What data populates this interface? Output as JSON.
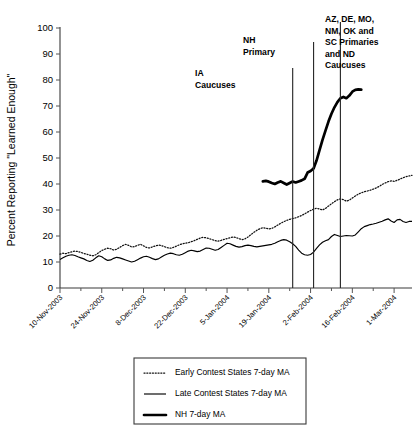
{
  "chart_data": {
    "type": "line",
    "title": "",
    "xlabel": "",
    "ylabel": "Percent Reporting \"Learned Enough\"",
    "ylim": [
      0,
      100
    ],
    "ytick_labels": [
      "0",
      "10",
      "20",
      "30",
      "40",
      "50",
      "60",
      "70",
      "80",
      "90",
      "100"
    ],
    "ytick_values": [
      0,
      10,
      20,
      30,
      40,
      50,
      60,
      70,
      80,
      90,
      100
    ],
    "grid": false,
    "legend_position": "below-plot",
    "x_axis_type": "date",
    "xtick_labels": [
      "10-Nov-2003",
      "24-Nov-2003",
      "8-Dec-2003",
      "22-Dec-2003",
      "5-Jan-2004",
      "19-Jan-2004",
      "2-Feb-2004",
      "16-Feb-2004",
      "1-Mar-2004"
    ],
    "xtick_day_indices": [
      0,
      14,
      28,
      42,
      56,
      70,
      84,
      98,
      112
    ],
    "x_range_days": [
      0,
      118
    ],
    "series": [
      {
        "name": "Early Contest States 7-day MA",
        "style": "dotted",
        "start_day": 0,
        "values": [
          13.0,
          13.4,
          13.2,
          13.6,
          13.9,
          14.2,
          14.0,
          13.7,
          13.3,
          13.0,
          12.6,
          12.4,
          12.8,
          13.6,
          14.4,
          14.9,
          15.3,
          15.1,
          14.6,
          14.9,
          15.6,
          16.3,
          16.8,
          16.4,
          15.8,
          15.9,
          16.4,
          16.8,
          16.2,
          15.6,
          15.4,
          15.8,
          16.2,
          16.5,
          16.3,
          15.9,
          15.5,
          15.3,
          15.6,
          16.1,
          16.6,
          17.0,
          17.2,
          17.4,
          17.8,
          18.2,
          18.7,
          19.2,
          19.5,
          19.3,
          19.0,
          18.6,
          18.2,
          18.0,
          18.3,
          18.7,
          19.0,
          19.3,
          19.6,
          19.4,
          19.0,
          18.6,
          18.9,
          19.6,
          20.5,
          21.4,
          22.2,
          22.8,
          23.2,
          23.0,
          22.7,
          22.9,
          23.5,
          24.2,
          24.9,
          25.5,
          26.0,
          26.4,
          26.7,
          27.0,
          27.4,
          27.9,
          28.5,
          29.2,
          29.8,
          30.3,
          30.7,
          30.4,
          30.0,
          30.6,
          31.5,
          32.4,
          33.2,
          33.9,
          34.3,
          34.0,
          33.4,
          33.8,
          34.6,
          35.4,
          36.1,
          36.6,
          37.0,
          37.3,
          37.6,
          38.0,
          38.5,
          39.1,
          39.8,
          40.4,
          40.9,
          41.2,
          41.0,
          41.4,
          41.9,
          42.4,
          42.8,
          43.1,
          43.3
        ]
      },
      {
        "name": "Late Contest States 7-day MA",
        "style": "solid-thin",
        "start_day": 0,
        "values": [
          11.0,
          11.6,
          12.2,
          12.6,
          12.8,
          12.5,
          12.0,
          11.6,
          11.2,
          10.6,
          10.2,
          10.7,
          11.6,
          12.4,
          12.0,
          11.2,
          10.6,
          10.8,
          11.4,
          11.8,
          11.6,
          11.2,
          10.8,
          10.4,
          10.0,
          10.3,
          10.9,
          11.5,
          12.0,
          12.2,
          11.8,
          11.3,
          10.9,
          11.2,
          11.9,
          12.6,
          13.1,
          13.4,
          13.2,
          12.8,
          12.6,
          13.0,
          13.6,
          14.2,
          14.5,
          14.3,
          14.0,
          14.2,
          14.8,
          15.4,
          15.3,
          14.9,
          14.5,
          14.8,
          15.6,
          16.4,
          17.2,
          17.0,
          16.5,
          16.0,
          15.7,
          15.9,
          16.3,
          16.5,
          16.3,
          16.0,
          15.8,
          16.0,
          16.2,
          16.4,
          16.6,
          16.8,
          17.2,
          17.8,
          18.3,
          18.6,
          18.4,
          17.8,
          17.0,
          16.0,
          14.6,
          13.4,
          12.8,
          12.6,
          12.9,
          13.8,
          15.2,
          16.6,
          17.6,
          18.2,
          18.6,
          19.8,
          20.6,
          20.2,
          19.8,
          20.0,
          20.2,
          20.1,
          20.0,
          20.4,
          21.6,
          22.8,
          23.6,
          24.0,
          24.4,
          24.6,
          24.9,
          25.3,
          25.7,
          26.2,
          26.6,
          25.8,
          25.2,
          26.2,
          26.4,
          25.6,
          25.2,
          25.6,
          25.6
        ]
      },
      {
        "name": "NH 7-day MA",
        "style": "solid-thick",
        "start_day": 68,
        "values": [
          41.0,
          41.2,
          40.9,
          40.4,
          40.0,
          40.6,
          41.0,
          40.4,
          39.8,
          40.4,
          41.0,
          40.6,
          41.0,
          41.4,
          42.0,
          44.4,
          45.0,
          46.0,
          49.0,
          53.0,
          57.0,
          60.5,
          64.0,
          67.0,
          69.5,
          71.5,
          73.0,
          73.5,
          73.0,
          74.0,
          75.5,
          76.2,
          76.4,
          76.3
        ]
      }
    ],
    "events": [
      {
        "label": "IA\nCaucuses",
        "day": 78,
        "label_lines": [
          "IA",
          "Caucuses"
        ]
      },
      {
        "label": "NH\nPrimary",
        "day": 85,
        "label_lines": [
          "NH",
          "Primary"
        ]
      },
      {
        "label": "AZ, DE, MO, NM, OK and SC Primaries and ND Caucuses",
        "day": 94,
        "label_lines": [
          "AZ, DE, MO,",
          "NM, OK and",
          "SC Primaries",
          "and ND",
          "Caucuses"
        ]
      }
    ],
    "legend": [
      {
        "label": "Early Contest States 7-day MA",
        "style": "dotted"
      },
      {
        "label": "Late Contest States 7-day MA",
        "style": "solid-thin"
      },
      {
        "label": "NH 7-day MA",
        "style": "solid-thick"
      }
    ],
    "colors": {
      "series": "#000000",
      "axis": "#3a3a3a",
      "background": "#ffffff"
    }
  }
}
